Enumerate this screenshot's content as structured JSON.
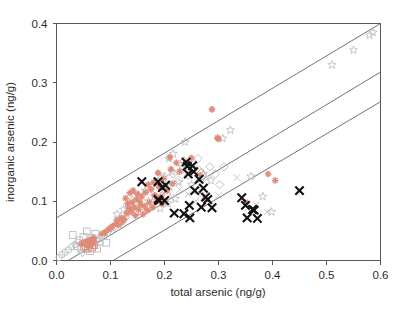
{
  "chart_data": {
    "type": "scatter",
    "title": "",
    "xlabel": "total arsenic (ng/g)",
    "ylabel": "inorganic arsenic (ng/g)",
    "xlim": [
      0.0,
      0.6
    ],
    "ylim": [
      0.0,
      0.4
    ],
    "xticks": [
      "0.0",
      "0.1",
      "0.2",
      "0.3",
      "0.4",
      "0.5",
      "0.6"
    ],
    "xtick_values": [
      0.0,
      0.1,
      0.2,
      0.3,
      0.4,
      0.5,
      0.6
    ],
    "yticks": [
      "0.0",
      "0.1",
      "0.2",
      "0.3",
      "0.4"
    ],
    "ytick_values": [
      0.0,
      0.1,
      0.2,
      0.3,
      0.4
    ],
    "grid": false,
    "legend": "none",
    "colors": {
      "black_series": "#111111",
      "red_series": "#e08a78",
      "gray_series": "#b9bcc0",
      "axis": "#555a5c",
      "reference_line": "#5f6466",
      "background": "#ffffff"
    },
    "reference_lines": [
      {
        "name": "upper-reference-line",
        "x1": 0.0,
        "y1": 0.072,
        "x2": 0.6,
        "y2": 0.4
      },
      {
        "name": "middle-reference-line",
        "x1": 0.0,
        "y1": -0.012,
        "x2": 0.6,
        "y2": 0.318
      },
      {
        "name": "lower-reference-line",
        "x1": 0.105,
        "y1": 0.0,
        "x2": 0.6,
        "y2": 0.268
      }
    ],
    "series": [
      {
        "name": "black-x-markers",
        "marker": "x",
        "color": "#111111",
        "points": [
          [
            0.158,
            0.133
          ],
          [
            0.188,
            0.133
          ],
          [
            0.188,
            0.103
          ],
          [
            0.19,
            0.101
          ],
          [
            0.196,
            0.123
          ],
          [
            0.2,
            0.101
          ],
          [
            0.202,
            0.127
          ],
          [
            0.218,
            0.08
          ],
          [
            0.236,
            0.079
          ],
          [
            0.24,
            0.166
          ],
          [
            0.242,
            0.159
          ],
          [
            0.244,
            0.146
          ],
          [
            0.246,
            0.093
          ],
          [
            0.247,
            0.072
          ],
          [
            0.252,
            0.16
          ],
          [
            0.254,
            0.15
          ],
          [
            0.256,
            0.118
          ],
          [
            0.264,
            0.137
          ],
          [
            0.268,
            0.09
          ],
          [
            0.272,
            0.122
          ],
          [
            0.276,
            0.107
          ],
          [
            0.28,
            0.103
          ],
          [
            0.288,
            0.089
          ],
          [
            0.343,
            0.106
          ],
          [
            0.35,
            0.093
          ],
          [
            0.353,
            0.072
          ],
          [
            0.363,
            0.086
          ],
          [
            0.366,
            0.085
          ],
          [
            0.372,
            0.071
          ],
          [
            0.45,
            0.118
          ]
        ]
      },
      {
        "name": "red-plus-markers",
        "marker": "plus",
        "color": "#e08a78",
        "points": [
          [
            0.046,
            0.028
          ],
          [
            0.05,
            0.03
          ],
          [
            0.054,
            0.031
          ],
          [
            0.056,
            0.026
          ],
          [
            0.058,
            0.033
          ],
          [
            0.06,
            0.029
          ],
          [
            0.062,
            0.034
          ],
          [
            0.064,
            0.03
          ],
          [
            0.066,
            0.036
          ],
          [
            0.068,
            0.031
          ],
          [
            0.07,
            0.038
          ],
          [
            0.085,
            0.045
          ],
          [
            0.09,
            0.048
          ],
          [
            0.096,
            0.052
          ],
          [
            0.1,
            0.055
          ],
          [
            0.104,
            0.058
          ],
          [
            0.11,
            0.062
          ],
          [
            0.112,
            0.068
          ],
          [
            0.115,
            0.06
          ],
          [
            0.12,
            0.072
          ],
          [
            0.122,
            0.065
          ],
          [
            0.125,
            0.07
          ],
          [
            0.128,
            0.105
          ],
          [
            0.13,
            0.08
          ],
          [
            0.132,
            0.096
          ],
          [
            0.134,
            0.088
          ],
          [
            0.136,
            0.114
          ],
          [
            0.138,
            0.082
          ],
          [
            0.14,
            0.098
          ],
          [
            0.142,
            0.118
          ],
          [
            0.144,
            0.09
          ],
          [
            0.146,
            0.076
          ],
          [
            0.148,
            0.103
          ],
          [
            0.15,
            0.112
          ],
          [
            0.152,
            0.086
          ],
          [
            0.154,
            0.1
          ],
          [
            0.156,
            0.094
          ],
          [
            0.158,
            0.108
          ],
          [
            0.16,
            0.078
          ],
          [
            0.163,
            0.092
          ],
          [
            0.165,
            0.115
          ],
          [
            0.168,
            0.085
          ],
          [
            0.17,
            0.128
          ],
          [
            0.172,
            0.098
          ],
          [
            0.175,
            0.12
          ],
          [
            0.178,
            0.09
          ],
          [
            0.18,
            0.132
          ],
          [
            0.182,
            0.11
          ],
          [
            0.185,
            0.1
          ],
          [
            0.188,
            0.148
          ],
          [
            0.19,
            0.124
          ],
          [
            0.192,
            0.106
          ],
          [
            0.195,
            0.096
          ],
          [
            0.198,
            0.138
          ],
          [
            0.2,
            0.1
          ],
          [
            0.205,
            0.118
          ],
          [
            0.21,
            0.174
          ],
          [
            0.212,
            0.154
          ],
          [
            0.215,
            0.13
          ],
          [
            0.222,
            0.165
          ],
          [
            0.228,
            0.15
          ],
          [
            0.25,
            0.173
          ],
          [
            0.266,
            0.143
          ],
          [
            0.275,
            0.103
          ],
          [
            0.288,
            0.255
          ],
          [
            0.298,
            0.207
          ],
          [
            0.3,
            0.205
          ],
          [
            0.35,
            0.098
          ],
          [
            0.392,
            0.146
          ],
          [
            0.405,
            0.135
          ]
        ]
      },
      {
        "name": "gray-square-markers",
        "marker": "square",
        "color": "#b9bcc0",
        "points": [
          [
            0.03,
            0.043
          ],
          [
            0.038,
            0.024
          ],
          [
            0.042,
            0.034
          ],
          [
            0.046,
            0.019
          ],
          [
            0.05,
            0.04
          ],
          [
            0.052,
            0.022
          ],
          [
            0.056,
            0.049
          ],
          [
            0.058,
            0.03
          ],
          [
            0.062,
            0.016
          ],
          [
            0.065,
            0.038
          ],
          [
            0.068,
            0.026
          ],
          [
            0.072,
            0.045
          ],
          [
            0.075,
            0.02
          ],
          [
            0.08,
            0.032
          ],
          [
            0.086,
            0.042
          ],
          [
            0.092,
            0.03
          ]
        ]
      },
      {
        "name": "gray-circle-markers",
        "marker": "circle",
        "color": "#b9bcc0",
        "points": [
          [
            0.005,
            0.005
          ],
          [
            0.01,
            0.01
          ],
          [
            0.016,
            0.014
          ],
          [
            0.022,
            0.018
          ],
          [
            0.028,
            0.023
          ],
          [
            0.034,
            0.027
          ],
          [
            0.04,
            0.031
          ]
        ]
      },
      {
        "name": "gray-triangle-down-markers",
        "marker": "triangle-down",
        "color": "#b9bcc0",
        "points": [
          [
            0.048,
            0.012
          ],
          [
            0.06,
            0.02
          ],
          [
            0.072,
            0.029
          ],
          [
            0.084,
            0.038
          ],
          [
            0.096,
            0.046
          ],
          [
            0.108,
            0.055
          ],
          [
            0.118,
            0.062
          ],
          [
            0.128,
            0.07
          ]
        ]
      },
      {
        "name": "gray-star-markers",
        "marker": "star",
        "color": "#b9bcc0",
        "points": [
          [
            0.112,
            0.078
          ],
          [
            0.124,
            0.086
          ],
          [
            0.132,
            0.094
          ],
          [
            0.14,
            0.102
          ],
          [
            0.148,
            0.082
          ],
          [
            0.152,
            0.11
          ],
          [
            0.158,
            0.09
          ],
          [
            0.164,
            0.118
          ],
          [
            0.17,
            0.1
          ],
          [
            0.176,
            0.126
          ],
          [
            0.182,
            0.108
          ],
          [
            0.188,
            0.134
          ],
          [
            0.192,
            0.088
          ],
          [
            0.196,
            0.116
          ],
          [
            0.2,
            0.142
          ],
          [
            0.206,
            0.096
          ],
          [
            0.21,
            0.124
          ],
          [
            0.214,
            0.15
          ],
          [
            0.22,
            0.104
          ],
          [
            0.226,
            0.132
          ],
          [
            0.232,
            0.158
          ],
          [
            0.208,
            0.172
          ],
          [
            0.216,
            0.18
          ],
          [
            0.238,
            0.2
          ],
          [
            0.25,
            0.128
          ],
          [
            0.262,
            0.118
          ],
          [
            0.272,
            0.146
          ],
          [
            0.286,
            0.135
          ],
          [
            0.308,
            0.206
          ],
          [
            0.322,
            0.22
          ],
          [
            0.36,
            0.142
          ],
          [
            0.382,
            0.108
          ],
          [
            0.398,
            0.082
          ],
          [
            0.51,
            0.33
          ],
          [
            0.55,
            0.355
          ],
          [
            0.58,
            0.38
          ],
          [
            0.586,
            0.385
          ]
        ]
      },
      {
        "name": "gray-diamond-markers",
        "marker": "diamond",
        "color": "#b9bcc0",
        "points": [
          [
            0.186,
            0.132
          ],
          [
            0.196,
            0.14
          ],
          [
            0.206,
            0.128
          ],
          [
            0.216,
            0.146
          ],
          [
            0.226,
            0.136
          ],
          [
            0.234,
            0.154
          ],
          [
            0.244,
            0.144
          ],
          [
            0.254,
            0.162
          ],
          [
            0.264,
            0.152
          ],
          [
            0.274,
            0.14
          ],
          [
            0.284,
            0.158
          ],
          [
            0.294,
            0.146
          ],
          [
            0.262,
            0.172
          ],
          [
            0.302,
            0.128
          ],
          [
            0.31,
            0.158
          ]
        ]
      },
      {
        "name": "red-diamond-markers",
        "marker": "diamond",
        "color": "#e08a78",
        "points": [
          [
            0.236,
            0.168
          ],
          [
            0.268,
            0.148
          ],
          [
            0.204,
            0.112
          ]
        ]
      },
      {
        "name": "gray-x-markers",
        "marker": "x",
        "color": "#b9bcc0",
        "points": [
          [
            0.18,
            0.108
          ],
          [
            0.196,
            0.116
          ],
          [
            0.212,
            0.106
          ],
          [
            0.228,
            0.12
          ],
          [
            0.244,
            0.112
          ],
          [
            0.258,
            0.1
          ],
          [
            0.27,
            0.112
          ],
          [
            0.286,
            0.098
          ],
          [
            0.3,
            0.11
          ],
          [
            0.334,
            0.14
          ],
          [
            0.354,
            0.088
          ],
          [
            0.37,
            0.094
          ],
          [
            0.39,
            0.082
          ]
        ]
      },
      {
        "name": "red-square-markers",
        "marker": "square",
        "color": "#e08a78",
        "points": [
          [
            0.054,
            0.024
          ],
          [
            0.06,
            0.028
          ],
          [
            0.066,
            0.022
          ],
          [
            0.07,
            0.026
          ],
          [
            0.058,
            0.02
          ],
          [
            0.064,
            0.032
          ]
        ]
      }
    ]
  }
}
